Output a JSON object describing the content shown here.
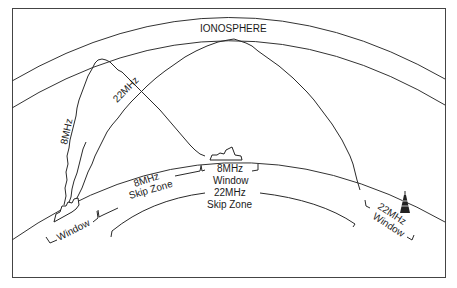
{
  "labels": {
    "ionosphere": "IONOSPHERE",
    "wave_8mhz": "8MHz",
    "wave_22mhz": "22MHz",
    "left_window": "Window",
    "skip_8_line1": "8MHz",
    "skip_8_line2": "Skip Zone",
    "window_8_line1": "8MHz",
    "window_8_line2": "Window",
    "skip_22_line1": "22MHz",
    "skip_22_line2": "Skip Zone",
    "window_22_line1": "22MHz",
    "window_22_line2": "Window"
  },
  "elements": {
    "transmitter_ship": "ship-icon",
    "receiver_ship": "ship-icon",
    "radio_tower": "antenna-tower-icon"
  },
  "colors": {
    "ink": "#222222",
    "background": "#ffffff"
  }
}
